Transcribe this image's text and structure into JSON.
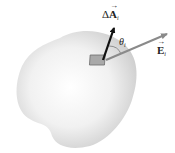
{
  "diagram": {
    "surface": {
      "fill_light": "#ffffff",
      "fill_dark": "#cfcfcf"
    },
    "patch": {
      "fill": "#a9a9a9",
      "stroke": "#6e6e6e"
    },
    "area_vector": {
      "prefix": "Δ",
      "symbol": "A",
      "subscript": "i",
      "color": "#111111"
    },
    "field_vector": {
      "symbol": "E",
      "subscript": "i",
      "color": "#8a8a8a"
    },
    "angle": {
      "symbol": "θ",
      "subscript": "i"
    }
  }
}
